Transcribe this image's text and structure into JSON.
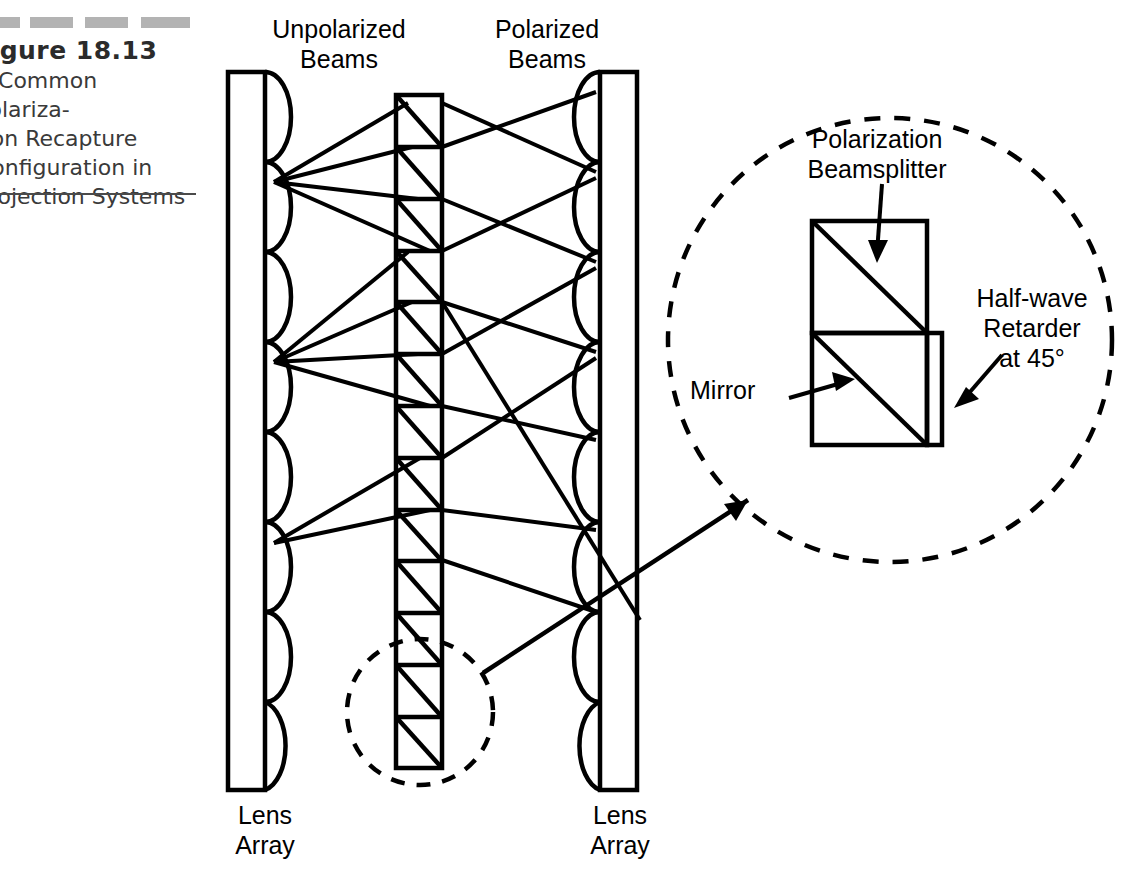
{
  "figure": {
    "number": "Figure 18.13",
    "description": "A Common Polariza-\ntion Recapture\nConfiguration in\nProjection Systems",
    "decor_dashes": 4
  },
  "diagram": {
    "labels": {
      "unpolarized_beams": "Unpolarized\nBeams",
      "polarized_beams": "Polarized\nBeams",
      "left_lens_array": "Lens\nArray",
      "right_lens_array": "Lens\nArray",
      "polarization_beamsplitter": "Polarization\nBeamsplitter",
      "half_wave_retarder": "Half-wave\nRetarder\nat 45°",
      "mirror": "Mirror"
    },
    "colors": {
      "stroke": "#000000",
      "background": "#ffffff",
      "decor_gray": "#9a9a9a",
      "caption_text": "#3a3a3a"
    },
    "geometry": {
      "left_array": {
        "x": 228,
        "width": 37,
        "top": 72,
        "bottom": 790,
        "lens_count": 8,
        "lens_bulge": 26,
        "side": "right"
      },
      "right_array": {
        "x": 600,
        "width": 37,
        "top": 72,
        "bottom": 790,
        "lens_count": 8,
        "lens_bulge": 26,
        "side": "left"
      },
      "pbs_column": {
        "x": 396,
        "width": 46,
        "top": 95,
        "bottom": 768,
        "cell_count": 13
      },
      "detail_circle": {
        "cx": 890,
        "cy": 340,
        "r": 222,
        "dashed": true
      },
      "callout_circle": {
        "cx": 420,
        "cy": 712,
        "r": 73,
        "dashed": true
      },
      "callout_arrow": {
        "x1": 492,
        "y1": 672,
        "x2": 752,
        "y2": 510
      }
    },
    "inset": {
      "pbs_box": {
        "x": 812,
        "y": 221,
        "w": 115,
        "h": 112
      },
      "mirror_box": {
        "x": 812,
        "y": 333,
        "w": 115,
        "h": 112
      },
      "retarder_strip": {
        "x": 927,
        "y": 333,
        "w": 14,
        "h": 112
      }
    }
  }
}
